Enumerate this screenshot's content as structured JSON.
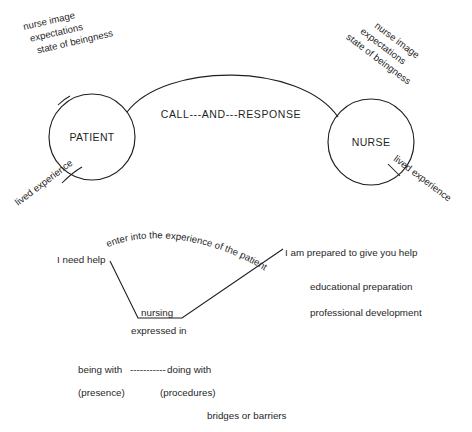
{
  "diagram": {
    "colors": {
      "background": "#ffffff",
      "ink": "#1f1f1f"
    },
    "nodes": {
      "patient": "PATIENT",
      "nurse": "NURSE"
    },
    "relation": {
      "call_and_response": "CALL---AND---RESPONSE"
    },
    "patient_annotations": {
      "top": [
        "nurse image",
        "expectations",
        "state of beingness"
      ],
      "bottom": "lived experience"
    },
    "nurse_annotations": {
      "top": [
        "nurse image",
        "expectations",
        "state of beingness"
      ],
      "bottom": "lived experience"
    },
    "lower": {
      "left_statement": "I need help",
      "right_statement": "I am prepared to give you help",
      "arc_label": "enter into the experience of the patient",
      "vertex_label": "nursing",
      "vertex_sub_label": "expressed in",
      "right_support": [
        "educational preparation",
        "professional development"
      ],
      "modes": {
        "left": "being with",
        "connector": "-----------",
        "right": "doing with",
        "left_paren": "(presence)",
        "right_paren": "(procedures)"
      },
      "outcome": "bridges or barriers"
    }
  }
}
